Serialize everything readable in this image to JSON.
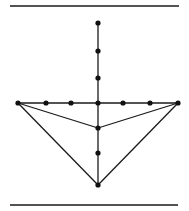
{
  "diagram": {
    "type": "graph",
    "colors": {
      "stroke": "#1a1a1a",
      "node": "#111111",
      "background": "#ffffff"
    },
    "rules": [
      {
        "name": "top-rule",
        "x1": 10,
        "y1": 6,
        "x2": 179,
        "y2": 6
      },
      {
        "name": "bottom-rule",
        "x1": 10,
        "y1": 205,
        "x2": 178,
        "y2": 205
      }
    ],
    "nodes": [
      {
        "id": "v-top",
        "x": 98,
        "y": 23
      },
      {
        "id": "v-2",
        "x": 98,
        "y": 51
      },
      {
        "id": "v-3",
        "x": 98,
        "y": 78
      },
      {
        "id": "center",
        "x": 98,
        "y": 103
      },
      {
        "id": "v-inner",
        "x": 98,
        "y": 128
      },
      {
        "id": "v-6",
        "x": 98,
        "y": 153
      },
      {
        "id": "v-bottom",
        "x": 98,
        "y": 185
      },
      {
        "id": "h-left",
        "x": 18,
        "y": 103
      },
      {
        "id": "h-2",
        "x": 46,
        "y": 103
      },
      {
        "id": "h-3",
        "x": 71,
        "y": 103
      },
      {
        "id": "h-5",
        "x": 123,
        "y": 103
      },
      {
        "id": "h-6",
        "x": 150,
        "y": 103
      },
      {
        "id": "h-right",
        "x": 178,
        "y": 103
      }
    ],
    "edges": [
      {
        "from": "v-top",
        "to": "v-bottom"
      },
      {
        "from": "h-left",
        "to": "h-right"
      },
      {
        "from": "h-left",
        "to": "v-inner"
      },
      {
        "from": "h-right",
        "to": "v-inner"
      },
      {
        "from": "h-left",
        "to": "v-bottom"
      },
      {
        "from": "h-right",
        "to": "v-bottom"
      }
    ]
  }
}
